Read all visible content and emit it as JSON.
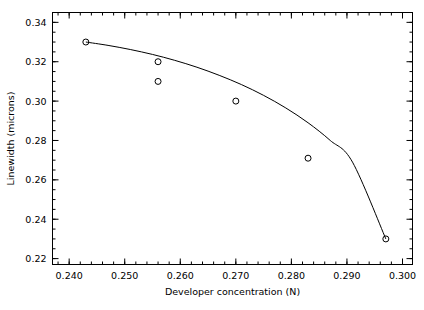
{
  "chart_data": {
    "type": "scatter",
    "title": "",
    "xlabel": "Developer concentration (N)",
    "ylabel": "Linewidth (microns)",
    "xlim": [
      0.237,
      0.3018
    ],
    "ylim": [
      0.217,
      0.345
    ],
    "grid": false,
    "legend": null,
    "x": [
      0.243,
      0.256,
      0.256,
      0.27,
      0.283,
      0.297
    ],
    "y": [
      0.33,
      0.32,
      0.31,
      0.3,
      0.271,
      0.23
    ],
    "points": [
      {
        "x": 0.243,
        "y": 0.33
      },
      {
        "x": 0.256,
        "y": 0.32
      },
      {
        "x": 0.256,
        "y": 0.31
      },
      {
        "x": 0.27,
        "y": 0.3
      },
      {
        "x": 0.283,
        "y": 0.271
      },
      {
        "x": 0.297,
        "y": 0.23
      }
    ],
    "marker": "open-circle",
    "fit_curve": {
      "label": "",
      "x": [
        0.243,
        0.247,
        0.251,
        0.255,
        0.259,
        0.263,
        0.267,
        0.271,
        0.275,
        0.279,
        0.283,
        0.287,
        0.291,
        0.297
      ],
      "y": [
        0.33,
        0.3283,
        0.3262,
        0.3237,
        0.3207,
        0.3172,
        0.3131,
        0.3084,
        0.3029,
        0.2965,
        0.289,
        0.28,
        0.269,
        0.23
      ]
    },
    "xticks": [
      0.24,
      0.25,
      0.26,
      0.27,
      0.28,
      0.29,
      0.3
    ],
    "xtick_labels": [
      "0.240",
      "0.250",
      "0.260",
      "0.270",
      "0.280",
      "0.290",
      "0.300"
    ],
    "yticks": [
      0.22,
      0.24,
      0.26,
      0.28,
      0.3,
      0.32,
      0.34
    ],
    "ytick_labels": [
      "0.22",
      "0.24",
      "0.26",
      "0.28",
      "0.30",
      "0.32",
      "0.34"
    ],
    "x_minor_per_major": 5,
    "y_minor_per_major": 4,
    "colors": {
      "axis": "#000000",
      "curve": "#000000",
      "marker": "#000000",
      "background": "#ffffff"
    }
  }
}
